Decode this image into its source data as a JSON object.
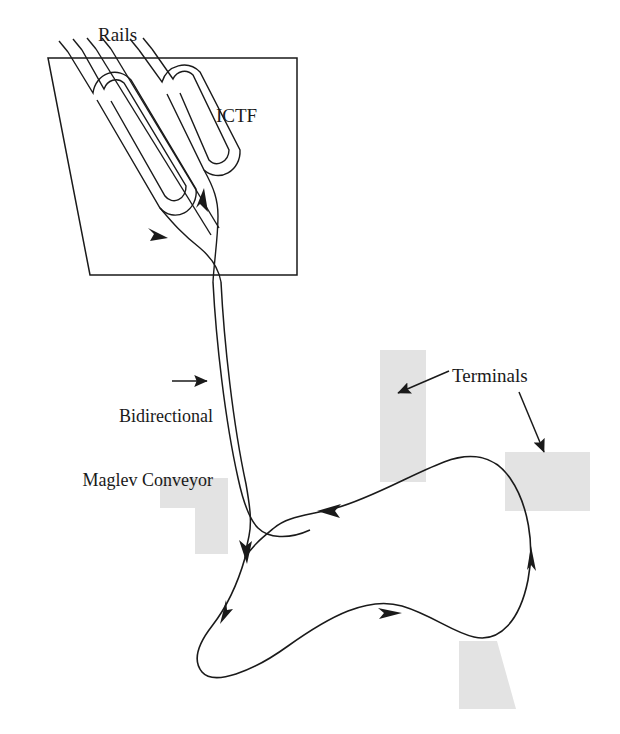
{
  "diagram": {
    "labels": {
      "rails": "Rails",
      "ictf": "ICTF",
      "conveyor_line1": "Bidirectional",
      "conveyor_line2": "Maglev Conveyor",
      "terminals": "Terminals"
    },
    "colors": {
      "stroke": "#1a1a1a",
      "terminal_fill": "#e3e3e3",
      "background": "#ffffff"
    },
    "geometry": {
      "ictf_box": {
        "x": 48,
        "y": 58,
        "width": 249,
        "height": 217,
        "skew_left": true
      },
      "rail_count": 6,
      "rail_loops": 2,
      "conveyor_tracks": 2,
      "loop_direction": "counterclockwise",
      "arrow_count": 6
    },
    "terminals": [
      {
        "name": "terminal-center",
        "x": 380,
        "y": 350,
        "width": 46,
        "height": 132
      },
      {
        "name": "terminal-right",
        "x": 505,
        "y": 452,
        "width": 83,
        "height": 58
      },
      {
        "name": "terminal-left",
        "x": 160,
        "y": 478,
        "width": 68,
        "height": 30
      },
      {
        "name": "terminal-left-lower",
        "x": 195,
        "y": 478,
        "width": 33,
        "height": 75
      },
      {
        "name": "terminal-bottom-right",
        "x": 457,
        "y": 640,
        "width": 60,
        "height": 68
      }
    ]
  }
}
